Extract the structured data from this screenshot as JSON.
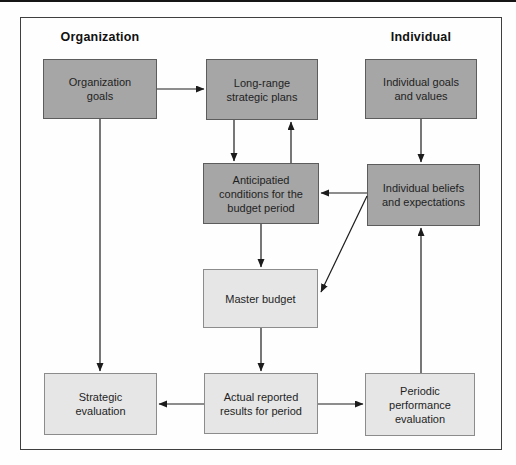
{
  "figure": {
    "column_headers": {
      "left": "Organization",
      "right": "Individual"
    },
    "nodes": {
      "organization_goals": {
        "label": "Organization\ngoals",
        "tone": "dark"
      },
      "long_range_plans": {
        "label": "Long-range\nstrategic plans",
        "tone": "dark"
      },
      "individual_goals": {
        "label": "Individual goals\nand values",
        "tone": "dark"
      },
      "anticipated_conditions": {
        "label": "Anticipatied\nconditions for the\nbudget period",
        "tone": "dark"
      },
      "individual_beliefs": {
        "label": "Individual beliefs\nand expectations",
        "tone": "dark"
      },
      "master_budget": {
        "label": "Master budget",
        "tone": "light"
      },
      "strategic_evaluation": {
        "label": "Strategic\nevaluation",
        "tone": "light"
      },
      "actual_results": {
        "label": "Actual reported\nresults for period",
        "tone": "light"
      },
      "periodic_evaluation": {
        "label": "Periodic\nperformance\nevaluation",
        "tone": "light"
      }
    },
    "edges": [
      {
        "from": "organization_goals",
        "to": "long_range_plans"
      },
      {
        "from": "long_range_plans",
        "to": "anticipated_conditions"
      },
      {
        "from": "anticipated_conditions",
        "to": "long_range_plans"
      },
      {
        "from": "individual_goals",
        "to": "individual_beliefs"
      },
      {
        "from": "individual_beliefs",
        "to": "anticipated_conditions"
      },
      {
        "from": "individual_beliefs",
        "to": "master_budget"
      },
      {
        "from": "anticipated_conditions",
        "to": "master_budget"
      },
      {
        "from": "master_budget",
        "to": "actual_results"
      },
      {
        "from": "organization_goals",
        "to": "strategic_evaluation"
      },
      {
        "from": "actual_results",
        "to": "strategic_evaluation"
      },
      {
        "from": "actual_results",
        "to": "periodic_evaluation"
      },
      {
        "from": "periodic_evaluation",
        "to": "individual_beliefs"
      }
    ],
    "colors": {
      "dark_box_fill": "#a6a6a6",
      "dark_box_border": "#5c5c5c",
      "light_box_fill": "#e6e6e6",
      "light_box_border": "#8c8c8c",
      "arrow": "#1c1c1c",
      "frame_border": "#3f3f3f",
      "background": "#fefefe"
    }
  }
}
